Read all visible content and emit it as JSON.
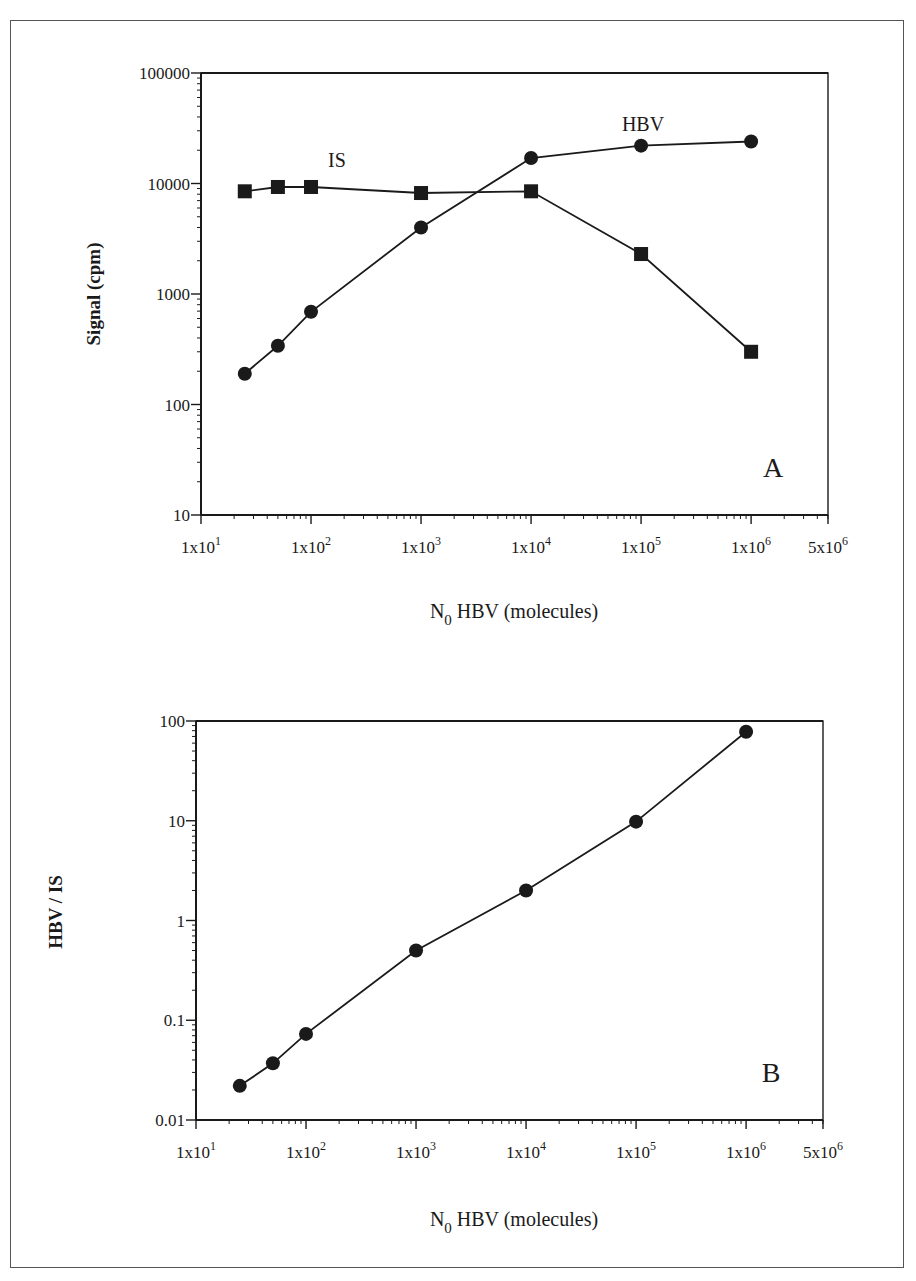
{
  "chart_data": [
    {
      "id": "A",
      "type": "line",
      "panel_label": "A",
      "title": "",
      "xlabel": "N0 HBV (molecules)",
      "xlabel_main": "N",
      "xlabel_sub": "0",
      "xlabel_rest": " HBV (molecules)",
      "ylabel": "Signal (cpm)",
      "xscale": "log",
      "yscale": "log",
      "xlim": [
        10,
        5000000
      ],
      "ylim": [
        10,
        100000
      ],
      "grid": false,
      "legend": "inline labels",
      "x_ticks": [
        {
          "value": 10,
          "base": "1x10",
          "exp": "1"
        },
        {
          "value": 100,
          "base": "1x10",
          "exp": "2"
        },
        {
          "value": 1000,
          "base": "1x10",
          "exp": "3"
        },
        {
          "value": 10000,
          "base": "1x10",
          "exp": "4"
        },
        {
          "value": 100000,
          "base": "1x10",
          "exp": "5"
        },
        {
          "value": 1000000,
          "base": "1x10",
          "exp": "6"
        },
        {
          "value": 5000000,
          "base": "5x10",
          "exp": "6"
        }
      ],
      "y_ticks": [
        {
          "value": 10,
          "label": "10"
        },
        {
          "value": 100,
          "label": "100"
        },
        {
          "value": 1000,
          "label": "1000"
        },
        {
          "value": 10000,
          "label": "10000"
        },
        {
          "value": 100000,
          "label": "100000"
        }
      ],
      "x": [
        25,
        50,
        100,
        1000,
        10000,
        100000,
        1000000
      ],
      "series": [
        {
          "name": "HBV",
          "marker": "circle",
          "values": [
            190,
            340,
            690,
            4000,
            17000,
            22000,
            24000
          ]
        },
        {
          "name": "IS",
          "marker": "square",
          "values": [
            8500,
            9300,
            9300,
            8200,
            8500,
            2300,
            300
          ]
        }
      ],
      "annotations": [
        {
          "text": "IS",
          "x": 200,
          "y": 13000
        },
        {
          "text": "HBV",
          "x": 100000,
          "y": 28000
        }
      ]
    },
    {
      "id": "B",
      "type": "line",
      "panel_label": "B",
      "title": "",
      "xlabel": "N0 HBV (molecules)",
      "xlabel_main": "N",
      "xlabel_sub": "0",
      "xlabel_rest": " HBV (molecules)",
      "ylabel": "HBV / IS",
      "xscale": "log",
      "yscale": "log",
      "xlim": [
        10,
        5000000
      ],
      "ylim": [
        0.01,
        100
      ],
      "grid": false,
      "legend": "none",
      "x_ticks": [
        {
          "value": 10,
          "base": "1x10",
          "exp": "1"
        },
        {
          "value": 100,
          "base": "1x10",
          "exp": "2"
        },
        {
          "value": 1000,
          "base": "1x10",
          "exp": "3"
        },
        {
          "value": 10000,
          "base": "1x10",
          "exp": "4"
        },
        {
          "value": 100000,
          "base": "1x10",
          "exp": "5"
        },
        {
          "value": 1000000,
          "base": "1x10",
          "exp": "6"
        },
        {
          "value": 5000000,
          "base": "5x10",
          "exp": "6"
        }
      ],
      "y_ticks": [
        {
          "value": 0.01,
          "label": "0.01"
        },
        {
          "value": 0.1,
          "label": "0.1"
        },
        {
          "value": 1,
          "label": "1"
        },
        {
          "value": 10,
          "label": "10"
        },
        {
          "value": 100,
          "label": "100"
        }
      ],
      "x": [
        25,
        50,
        100,
        1000,
        10000,
        100000,
        1000000
      ],
      "series": [
        {
          "name": "HBV/IS",
          "marker": "circle",
          "values": [
            0.022,
            0.037,
            0.073,
            0.5,
            2.0,
            9.8,
            78
          ]
        }
      ]
    }
  ],
  "colors": {
    "ink": "#1a1a1a",
    "frame": "#555555",
    "background": "#ffffff"
  }
}
